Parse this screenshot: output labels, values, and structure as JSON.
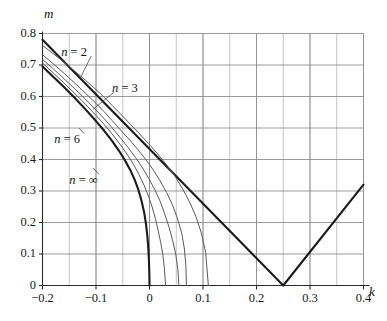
{
  "chart_data": {
    "type": "line",
    "title": "",
    "xlabel": "k",
    "ylabel": "m",
    "xlim": [
      -0.2,
      0.4
    ],
    "ylim": [
      0.0,
      0.8
    ],
    "xticks": [
      -0.2,
      -0.1,
      0.0,
      0.1,
      0.2,
      0.3,
      0.4
    ],
    "xticklabels": [
      "-0.2",
      "-0.1",
      "0",
      "0.1",
      "0.2",
      "0.3",
      "0.4"
    ],
    "yticks": [
      0.0,
      0.1,
      0.2,
      0.3,
      0.4,
      0.5,
      0.6,
      0.7,
      0.8
    ],
    "yticklabels": [
      "0",
      "0.1",
      "0.2",
      "0.3",
      "0.4",
      "0.5",
      "0.6",
      "0.7",
      "0.8"
    ],
    "grid": true,
    "grid_minor_x_step": 0.05,
    "grid_major_y_step": 0.1,
    "legend": "inline-annotations",
    "annotations": [
      {
        "text": "n = 2",
        "x": -0.165,
        "y": 0.735,
        "leader_to_x": -0.128,
        "leader_to_y": 0.663
      },
      {
        "text": "n = 3",
        "x": -0.07,
        "y": 0.62,
        "leader_to_x": -0.105,
        "leader_to_y": 0.56
      },
      {
        "text": "n = 6",
        "x": -0.178,
        "y": 0.46,
        "leader_to_x": -0.132,
        "leader_to_y": 0.5
      },
      {
        "text": "n = ∞",
        "x": -0.15,
        "y": 0.33,
        "leader_to_x": -0.105,
        "leader_to_y": 0.372
      }
    ],
    "series": [
      {
        "name": "V-line",
        "style": "thick-solid",
        "comment": "piecewise-linear: descends from left edge to vertex at k=0.25,m=0, then ascends",
        "points": [
          [
            -0.2,
            0.78
          ],
          [
            0.25,
            0.0
          ],
          [
            0.4,
            0.32
          ]
        ]
      },
      {
        "name": "n = ∞",
        "style": "thick-solid",
        "points": [
          [
            -0.2,
            0.695
          ],
          [
            -0.18,
            0.663
          ],
          [
            -0.16,
            0.63
          ],
          [
            -0.14,
            0.596
          ],
          [
            -0.12,
            0.56
          ],
          [
            -0.1,
            0.522
          ],
          [
            -0.085,
            0.492
          ],
          [
            -0.07,
            0.459
          ],
          [
            -0.058,
            0.43
          ],
          [
            -0.046,
            0.398
          ],
          [
            -0.036,
            0.367
          ],
          [
            -0.028,
            0.337
          ],
          [
            -0.021,
            0.305
          ],
          [
            -0.015,
            0.27
          ],
          [
            -0.01,
            0.232
          ],
          [
            -0.0065,
            0.195
          ],
          [
            -0.004,
            0.157
          ],
          [
            -0.0022,
            0.118
          ],
          [
            -0.001,
            0.078
          ],
          [
            -0.0003,
            0.038
          ],
          [
            0.0,
            0.0
          ]
        ]
      },
      {
        "name": "n = 6",
        "style": "thin-solid",
        "points": [
          [
            -0.2,
            0.706
          ],
          [
            -0.18,
            0.675
          ],
          [
            -0.16,
            0.643
          ],
          [
            -0.14,
            0.61
          ],
          [
            -0.12,
            0.576
          ],
          [
            -0.1,
            0.54
          ],
          [
            -0.085,
            0.512
          ],
          [
            -0.07,
            0.481
          ],
          [
            -0.055,
            0.448
          ],
          [
            -0.042,
            0.417
          ],
          [
            -0.03,
            0.385
          ],
          [
            -0.02,
            0.353
          ],
          [
            -0.01,
            0.318
          ],
          [
            -0.002,
            0.284
          ],
          [
            0.005,
            0.249
          ],
          [
            0.011,
            0.213
          ],
          [
            0.016,
            0.176
          ],
          [
            0.021,
            0.136
          ],
          [
            0.025,
            0.097
          ],
          [
            0.028,
            0.052
          ],
          [
            0.03,
            0.0
          ]
        ]
      },
      {
        "name": "n = 4",
        "style": "thin-solid",
        "points": [
          [
            -0.2,
            0.718
          ],
          [
            -0.18,
            0.688
          ],
          [
            -0.16,
            0.657
          ],
          [
            -0.14,
            0.625
          ],
          [
            -0.12,
            0.592
          ],
          [
            -0.1,
            0.557
          ],
          [
            -0.085,
            0.53
          ],
          [
            -0.07,
            0.501
          ],
          [
            -0.055,
            0.47
          ],
          [
            -0.04,
            0.438
          ],
          [
            -0.026,
            0.406
          ],
          [
            -0.013,
            0.373
          ],
          [
            -0.001,
            0.339
          ],
          [
            0.01,
            0.304
          ],
          [
            0.02,
            0.267
          ],
          [
            0.028,
            0.229
          ],
          [
            0.036,
            0.188
          ],
          [
            0.043,
            0.145
          ],
          [
            0.049,
            0.1
          ],
          [
            0.053,
            0.052
          ],
          [
            0.055,
            0.0
          ]
        ]
      },
      {
        "name": "n = 3",
        "style": "thin-solid",
        "points": [
          [
            -0.2,
            0.733
          ],
          [
            -0.18,
            0.704
          ],
          [
            -0.16,
            0.674
          ],
          [
            -0.14,
            0.643
          ],
          [
            -0.12,
            0.611
          ],
          [
            -0.1,
            0.578
          ],
          [
            -0.085,
            0.552
          ],
          [
            -0.07,
            0.524
          ],
          [
            -0.055,
            0.495
          ],
          [
            -0.038,
            0.464
          ],
          [
            -0.022,
            0.432
          ],
          [
            -0.007,
            0.4
          ],
          [
            0.007,
            0.367
          ],
          [
            0.02,
            0.332
          ],
          [
            0.032,
            0.295
          ],
          [
            0.043,
            0.256
          ],
          [
            0.052,
            0.214
          ],
          [
            0.06,
            0.168
          ],
          [
            0.065,
            0.119
          ],
          [
            0.068,
            0.064
          ],
          [
            0.069,
            0.0
          ]
        ]
      },
      {
        "name": "n = 2",
        "style": "thin-solid",
        "points": [
          [
            -0.2,
            0.762
          ],
          [
            -0.18,
            0.736
          ],
          [
            -0.16,
            0.709
          ],
          [
            -0.14,
            0.681
          ],
          [
            -0.12,
            0.652
          ],
          [
            -0.1,
            0.622
          ],
          [
            -0.085,
            0.598
          ],
          [
            -0.07,
            0.572
          ],
          [
            -0.055,
            0.546
          ],
          [
            -0.038,
            0.516
          ],
          [
            -0.02,
            0.484
          ],
          [
            -0.002,
            0.451
          ],
          [
            0.015,
            0.418
          ],
          [
            0.032,
            0.383
          ],
          [
            0.048,
            0.346
          ],
          [
            0.062,
            0.307
          ],
          [
            0.075,
            0.265
          ],
          [
            0.087,
            0.218
          ],
          [
            0.097,
            0.166
          ],
          [
            0.105,
            0.105
          ],
          [
            0.11,
            0.0
          ]
        ]
      }
    ]
  },
  "axes": {
    "y_axis_title": "m",
    "x_axis_title": "k"
  }
}
